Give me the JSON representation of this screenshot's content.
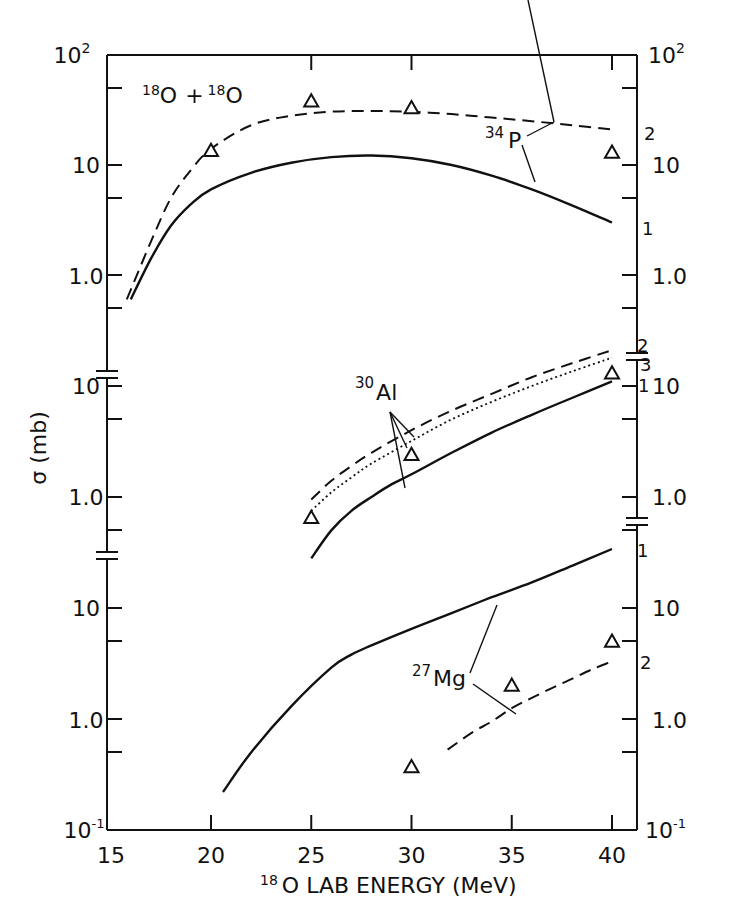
{
  "chart_data": {
    "type": "line",
    "xlabel": "18O LAB ENERGY (MeV)",
    "ylabel": "σ (mb)",
    "xlim": [
      15,
      41
    ],
    "x_ticks": [
      15,
      20,
      25,
      30,
      35,
      40
    ],
    "x_tick_labels": [
      "15",
      "20",
      "25",
      "30",
      "35",
      "40"
    ],
    "grid": false,
    "legend": "none (curves labelled 1, 2, 3 inline)",
    "panels": [
      {
        "name": "34P",
        "label": "34P",
        "ylim": [
          0.5,
          100
        ],
        "y_tick_labels_left": [
          "10²",
          "10",
          "1.0"
        ],
        "y_tick_labels_right": [
          "10²",
          "10",
          "1.0"
        ],
        "series": [
          {
            "name": "1",
            "style": "solid",
            "x": [
              16.0,
              17,
              18,
              19,
              20,
              22,
              24,
              26,
              28,
              30,
              32,
              34,
              36,
              38,
              40
            ],
            "y": [
              0.6,
              1.4,
              2.8,
              4.4,
              6.0,
              8.5,
              10.5,
              11.8,
              12.2,
              11.5,
              10.0,
              8.0,
              6.0,
              4.3,
              3.0
            ]
          },
          {
            "name": "2",
            "style": "dashed",
            "x": [
              15.8,
              17,
              18,
              19,
              20,
              22,
              24,
              26,
              28,
              30,
              32,
              34,
              36,
              38,
              40
            ],
            "y": [
              0.6,
              2.0,
              5.0,
              9.0,
              14.0,
              23.0,
              28.0,
              30.5,
              31.0,
              30.5,
              29.0,
              27.0,
              25.0,
              23.0,
              21.0
            ]
          }
        ],
        "data_points": {
          "marker": "triangle",
          "x": [
            20,
            25,
            30,
            40
          ],
          "y": [
            13.5,
            38.0,
            33.0,
            13.0
          ]
        }
      },
      {
        "name": "30Al",
        "label": "30Al",
        "ylim": [
          0.35,
          40
        ],
        "y_tick_labels_left": [
          "10",
          "1.0"
        ],
        "y_tick_labels_right": [
          "10",
          "1.0"
        ],
        "series": [
          {
            "name": "1",
            "style": "solid",
            "x": [
              25,
              26,
              27,
              28,
              29,
              30,
              32,
              34,
              36,
              38,
              40
            ],
            "y": [
              0.28,
              0.5,
              0.75,
              1.0,
              1.3,
              1.6,
              2.5,
              3.8,
              5.5,
              7.8,
              11.0
            ]
          },
          {
            "name": "2",
            "style": "dashed",
            "x": [
              25,
              26,
              27,
              28,
              30,
              32,
              34,
              36,
              38,
              40
            ],
            "y": [
              0.95,
              1.4,
              1.9,
              2.5,
              4.0,
              6.0,
              8.5,
              12.0,
              16.0,
              21.0
            ]
          },
          {
            "name": "3",
            "style": "dotted",
            "x": [
              25,
              26,
              27,
              28,
              30,
              32,
              34,
              36,
              38,
              40
            ],
            "y": [
              0.75,
              1.1,
              1.5,
              2.0,
              3.2,
              5.0,
              7.2,
              10.0,
              13.5,
              18.0
            ]
          }
        ],
        "data_points": {
          "marker": "triangle",
          "x": [
            25,
            30,
            40
          ],
          "y": [
            0.65,
            2.4,
            13.0
          ]
        }
      },
      {
        "name": "27Mg",
        "label": "27Mg",
        "ylim": [
          0.1,
          40
        ],
        "y_tick_labels_left": [
          "10",
          "1.0",
          "10⁻¹"
        ],
        "y_tick_labels_right": [
          "10",
          "1.0",
          "10⁻¹"
        ],
        "series": [
          {
            "name": "1",
            "style": "solid",
            "x": [
              20.6,
              22,
              24,
              26,
              27,
              28,
              30,
              32,
              34,
              36,
              38,
              40
            ],
            "y": [
              0.22,
              0.5,
              1.3,
              2.9,
              3.8,
              4.6,
              6.5,
              9.0,
              12.5,
              17.0,
              24.0,
              34.0
            ]
          },
          {
            "name": "2",
            "style": "dashed",
            "x": [
              31.8,
              33,
              34,
              35,
              36,
              37,
              38,
              39,
              40
            ],
            "y": [
              0.53,
              0.75,
              0.95,
              1.25,
              1.55,
              1.9,
              2.3,
              2.8,
              3.3
            ]
          }
        ],
        "data_points": {
          "marker": "triangle",
          "x": [
            30,
            35,
            40
          ],
          "y": [
            0.37,
            2.0,
            5.0
          ]
        }
      }
    ]
  },
  "labels": {
    "system_mass_a": "18",
    "system_element_a": "O",
    "system_plus": "+",
    "system_mass_b": "18",
    "system_element_b": "O",
    "ylabel": "σ (mb)",
    "xlabel_mass": "18",
    "xlabel_text": "O LAB ENERGY (MeV)",
    "p34_mass": "34",
    "p34_el": "P",
    "al30_mass": "30",
    "al30_el": "Al",
    "mg27_mass": "27",
    "mg27_el": "Mg",
    "curve_1": "1",
    "curve_2": "2",
    "curve_3": "3",
    "tick_100_base": "10",
    "tick_100_exp": "2",
    "tick_10": "10",
    "tick_1": "1.0",
    "tick_01_base": "10",
    "tick_01_exp": "-1"
  }
}
